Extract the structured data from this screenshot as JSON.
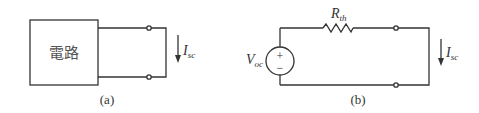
{
  "figure_a": {
    "box_label": "電路",
    "current_label_main": "I",
    "current_label_sub": "sc",
    "caption": "(a)"
  },
  "figure_b": {
    "source_label_main": "V",
    "source_label_sub": "oc",
    "source_plus": "+",
    "source_minus": "−",
    "resistor_label_main": "R",
    "resistor_label_sub": "th",
    "current_label_main": "I",
    "current_label_sub": "sc",
    "caption": "(b)"
  },
  "colors": {
    "stroke": "#333333",
    "background": "#ffffff"
  }
}
